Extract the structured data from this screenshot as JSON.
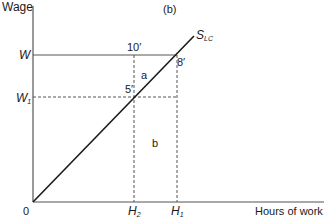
{
  "diagram": {
    "panel_label": "(b)",
    "axes": {
      "y_label": "Wage",
      "x_label": "Hours of work",
      "origin": "0"
    },
    "y_ticks": [
      {
        "main": "W",
        "sub": ""
      },
      {
        "main": "W",
        "sub": "1"
      }
    ],
    "x_ticks": [
      {
        "main": "H",
        "sub": "2"
      },
      {
        "main": "H",
        "sub": "1"
      }
    ],
    "curve": {
      "main": "S",
      "sub": "LC"
    },
    "points": [
      "10′",
      "8′",
      "5′"
    ],
    "regions": [
      "a",
      "b"
    ],
    "colors": {
      "line": "#1a1a1a",
      "axis": "#555555",
      "dashed": "#555555"
    }
  }
}
